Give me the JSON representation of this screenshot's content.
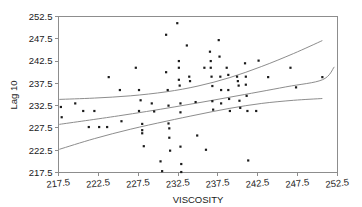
{
  "chart_data": {
    "type": "scatter",
    "title": "",
    "xlabel": "VISCOSITY",
    "ylabel": "Lag 10",
    "xlim": [
      217.5,
      252.5
    ],
    "ylim": [
      217.5,
      252.5
    ],
    "xticks": [
      217.5,
      222.5,
      227.5,
      232.5,
      237.5,
      242.5,
      247.5,
      252.5
    ],
    "yticks": [
      217.5,
      222.5,
      227.5,
      232.5,
      237.5,
      242.5,
      247.5,
      252.5
    ],
    "xtick_labels": [
      "217.5",
      "222.5",
      "227.5",
      "232.5",
      "237.5",
      "242.5",
      "247.5",
      "252.5"
    ],
    "ytick_labels": [
      "217.5",
      "222.5",
      "227.5",
      "232.5",
      "237.5",
      "242.5",
      "247.5",
      "252.5"
    ],
    "grid": false,
    "legend": "none",
    "marker": "square",
    "marker_color": "#1b1b1b",
    "line_color": "#8d8d8d",
    "points": [
      [
        217.8,
        232.2
      ],
      [
        217.9,
        229.9
      ],
      [
        219.6,
        233.0
      ],
      [
        220.6,
        231.3
      ],
      [
        222.0,
        231.3
      ],
      [
        221.3,
        227.7
      ],
      [
        222.6,
        227.7
      ],
      [
        223.6,
        227.7
      ],
      [
        223.8,
        238.9
      ],
      [
        225.2,
        236.0
      ],
      [
        225.4,
        229.0
      ],
      [
        227.2,
        241.0
      ],
      [
        227.6,
        236.0
      ],
      [
        227.6,
        231.3
      ],
      [
        227.8,
        233.7
      ],
      [
        228.0,
        228.4
      ],
      [
        228.0,
        227.0
      ],
      [
        228.0,
        226.3
      ],
      [
        228.2,
        223.4
      ],
      [
        229.2,
        233.0
      ],
      [
        229.5,
        231.2
      ],
      [
        230.3,
        220.0
      ],
      [
        230.5,
        217.8
      ],
      [
        231.0,
        248.4
      ],
      [
        231.0,
        240.0
      ],
      [
        231.2,
        236.0
      ],
      [
        231.3,
        232.5
      ],
      [
        231.3,
        228.5
      ],
      [
        231.4,
        227.4
      ],
      [
        231.4,
        225.3
      ],
      [
        231.5,
        222.4
      ],
      [
        232.4,
        251.0
      ],
      [
        232.6,
        242.5
      ],
      [
        232.6,
        241.0
      ],
      [
        232.6,
        238.3
      ],
      [
        232.7,
        237.0
      ],
      [
        232.8,
        233.0
      ],
      [
        232.8,
        231.0
      ],
      [
        232.8,
        223.3
      ],
      [
        232.9,
        219.4
      ],
      [
        232.9,
        217.6
      ],
      [
        233.6,
        246.0
      ],
      [
        233.9,
        239.0
      ],
      [
        234.0,
        238.0
      ],
      [
        234.7,
        233.3
      ],
      [
        234.9,
        225.8
      ],
      [
        235.8,
        241.0
      ],
      [
        236.0,
        222.6
      ],
      [
        236.5,
        244.6
      ],
      [
        236.6,
        242.5
      ],
      [
        236.6,
        241.0
      ],
      [
        236.7,
        239.0
      ],
      [
        236.8,
        236.9
      ],
      [
        236.8,
        233.5
      ],
      [
        236.9,
        231.6
      ],
      [
        237.6,
        247.2
      ],
      [
        237.7,
        243.5
      ],
      [
        237.8,
        239.0
      ],
      [
        237.9,
        236.0
      ],
      [
        237.9,
        233.0
      ],
      [
        238.6,
        241.0
      ],
      [
        238.8,
        239.4
      ],
      [
        238.8,
        236.0
      ],
      [
        238.9,
        234.0
      ],
      [
        239.0,
        231.3
      ],
      [
        239.9,
        239.0
      ],
      [
        240.0,
        238.0
      ],
      [
        240.1,
        237.0
      ],
      [
        240.2,
        233.6
      ],
      [
        240.3,
        232.0
      ],
      [
        240.9,
        242.0
      ],
      [
        241.0,
        239.0
      ],
      [
        241.0,
        237.2
      ],
      [
        241.1,
        234.7
      ],
      [
        241.2,
        231.3
      ],
      [
        241.3,
        220.2
      ],
      [
        242.3,
        231.3
      ],
      [
        242.6,
        242.6
      ],
      [
        243.8,
        238.9
      ],
      [
        246.6,
        241.0
      ],
      [
        247.3,
        236.6
      ],
      [
        250.6,
        238.9
      ]
    ],
    "curves": [
      {
        "name": "upper-confidence-band",
        "points": [
          [
            217.6,
            233.9
          ],
          [
            222.0,
            234.2
          ],
          [
            226.5,
            234.7
          ],
          [
            231.0,
            235.6
          ],
          [
            235.0,
            236.9
          ],
          [
            239.0,
            238.8
          ],
          [
            243.0,
            241.3
          ],
          [
            247.0,
            244.2
          ],
          [
            250.6,
            247.1
          ]
        ]
      },
      {
        "name": "regression-line",
        "points": [
          [
            217.6,
            228.3
          ],
          [
            225.0,
            230.2
          ],
          [
            232.0,
            232.2
          ],
          [
            239.0,
            234.4
          ],
          [
            246.0,
            236.7
          ],
          [
            250.6,
            238.3
          ],
          [
            252.1,
            241.2
          ]
        ]
      },
      {
        "name": "lower-confidence-band",
        "points": [
          [
            217.6,
            222.7
          ],
          [
            222.0,
            225.1
          ],
          [
            226.5,
            227.2
          ],
          [
            231.0,
            229.0
          ],
          [
            235.0,
            230.5
          ],
          [
            239.0,
            231.9
          ],
          [
            243.0,
            233.0
          ],
          [
            247.0,
            233.7
          ],
          [
            250.6,
            234.1
          ]
        ]
      }
    ]
  }
}
